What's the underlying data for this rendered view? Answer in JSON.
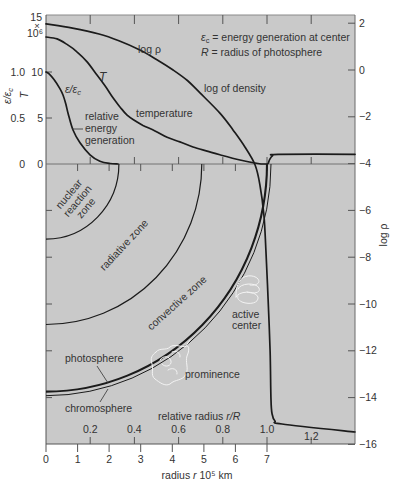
{
  "figure": {
    "colors": {
      "page_background": "#ffffff",
      "plot_background": "#c9c9c9",
      "curves": "#1b1b1b",
      "highlight_outline": "#f3f3f3"
    }
  },
  "chart_data": {
    "type": "line",
    "title": "",
    "legend_notes": [
      {
        "symbol": "ε",
        "sub": "c",
        "text": " = energy generation at center"
      },
      {
        "symbol": "R",
        "sub": "",
        "text": " = radius of photosphere"
      }
    ],
    "x_axes": {
      "bottom": {
        "label": "radius r 10⁵ km",
        "label_pre": "radius ",
        "label_var": "r",
        "label_post": " 10⁵ km",
        "ticks": [
          0,
          1,
          2,
          3,
          4,
          5,
          6,
          7
        ],
        "tick_labels": [
          "0",
          "1",
          "2",
          "3",
          "4",
          "5",
          "6",
          "7"
        ],
        "range": [
          0,
          9.8
        ]
      },
      "relative": {
        "label": "relative radius r/R",
        "label_pre": "relative radius ",
        "label_var": "r/R",
        "ticks": [
          0.2,
          0.4,
          0.6,
          0.8,
          1.0,
          1.2
        ],
        "tick_labels": [
          "0.2",
          "0.4",
          "0.6",
          "0.8",
          "1.0",
          "1.2"
        ],
        "range": [
          0,
          1.4
        ]
      }
    },
    "y_axes": {
      "left_T": {
        "label": "T",
        "unit": "10⁶ K",
        "ticks": [
          0,
          5,
          10,
          15
        ],
        "tick_labels": [
          "0",
          "5",
          "10"
        ],
        "top_label": {
          "value": "15",
          "times": "×",
          "multiplier": "10⁶"
        },
        "range": [
          0,
          16
        ]
      },
      "left_eps": {
        "label": "ε/εc",
        "label_main": "ε/ε",
        "label_sub": "c",
        "ticks": [
          0,
          0.5,
          1.0
        ],
        "tick_labels": [
          "0",
          "0.5",
          "1.0"
        ],
        "range": [
          0,
          1.6
        ]
      },
      "right_log_rho": {
        "label": "log ρ",
        "ticks": [
          2,
          0,
          -2,
          -4,
          -6,
          -8,
          -10,
          -12,
          -14,
          -16
        ],
        "tick_labels": [
          "2",
          "0",
          "−2",
          "−4",
          "−6",
          "−8",
          "−10",
          "−12",
          "−14",
          "−16"
        ],
        "range": [
          -16,
          2
        ]
      }
    },
    "series": [
      {
        "id": "log-density",
        "name": "log ρ",
        "label": "log of density",
        "axis": "right_log_rho",
        "x": "r/R",
        "points": [
          [
            0,
            1.97
          ],
          [
            0.12,
            1.79
          ],
          [
            0.24,
            1.54
          ],
          [
            0.33,
            1.25
          ],
          [
            0.425,
            0.85
          ],
          [
            0.5,
            0.45
          ],
          [
            0.575,
            0.0
          ],
          [
            0.64,
            -0.45
          ],
          [
            0.697,
            -0.98
          ],
          [
            0.787,
            -1.84
          ],
          [
            0.846,
            -2.56
          ],
          [
            0.9,
            -3.29
          ],
          [
            0.946,
            -4.06
          ],
          [
            0.968,
            -4.91
          ],
          [
            0.986,
            -6.2
          ],
          [
            0.995,
            -7.7
          ],
          [
            1.005,
            -9.8
          ],
          [
            1.014,
            -12.0
          ],
          [
            1.018,
            -14.1
          ],
          [
            1.023,
            -14.7
          ],
          [
            1.036,
            -15.0
          ],
          [
            1.068,
            -15.13
          ],
          [
            1.398,
            -15.47
          ]
        ]
      },
      {
        "id": "temperature",
        "name": "T",
        "label": "temperature",
        "axis": "left_T",
        "x": "r/R",
        "points": [
          [
            0,
            13.8
          ],
          [
            0.05,
            13.6
          ],
          [
            0.095,
            13.0
          ],
          [
            0.14,
            12.2
          ],
          [
            0.186,
            11.1
          ],
          [
            0.23,
            9.7
          ],
          [
            0.267,
            8.5
          ],
          [
            0.303,
            7.2
          ],
          [
            0.335,
            6.2
          ],
          [
            0.367,
            5.3
          ],
          [
            0.403,
            4.7
          ],
          [
            0.439,
            4.2
          ],
          [
            0.493,
            3.6
          ],
          [
            0.548,
            2.9
          ],
          [
            0.606,
            2.4
          ],
          [
            0.665,
            1.85
          ],
          [
            0.729,
            1.4
          ],
          [
            0.787,
            1.0
          ],
          [
            0.878,
            0.43
          ],
          [
            0.959,
            0.05
          ],
          [
            0.993,
            0.0
          ],
          [
            1.005,
            0.05
          ],
          [
            1.012,
            0.5
          ],
          [
            1.025,
            0.9
          ],
          [
            1.05,
            1.05
          ],
          [
            1.398,
            1.05
          ]
        ]
      },
      {
        "id": "relative-energy-generation",
        "name": "ε/εc",
        "label": "relative energy generation",
        "axis": "left_eps",
        "x": "r/R",
        "points": [
          [
            0,
            1.0
          ],
          [
            0.014,
            0.98
          ],
          [
            0.036,
            0.92
          ],
          [
            0.063,
            0.82
          ],
          [
            0.077,
            0.75
          ],
          [
            0.09,
            0.65
          ],
          [
            0.1,
            0.55
          ],
          [
            0.122,
            0.37
          ],
          [
            0.154,
            0.23
          ],
          [
            0.199,
            0.1
          ],
          [
            0.244,
            0.03
          ],
          [
            0.29,
            0.005
          ],
          [
            0.326,
            0.0
          ]
        ]
      }
    ],
    "zones": [
      {
        "id": "nuclear-reaction-zone",
        "name": "nuclear reaction zone",
        "outer_r_rel": 0.33
      },
      {
        "id": "radiative-zone",
        "name": "radiative zone",
        "outer_r_rel": 0.705
      },
      {
        "id": "photosphere",
        "name": "photosphere",
        "outer_r_rel": 1.0
      },
      {
        "id": "chromosphere",
        "name": "chromosphere",
        "outer_r_rel": 1.018
      }
    ],
    "annotations": {
      "log_rho_curve_label": "log ρ",
      "T_curve_label": "T",
      "eps_curve_label_main": "ε/ε",
      "eps_curve_label_sub": "c",
      "log_density": "log of density",
      "temperature": "temperature",
      "relative_energy_generation": [
        "relative",
        "energy",
        "generation"
      ],
      "nuclear_reaction_zone": [
        "nuclear",
        "reaction",
        "zone"
      ],
      "radiative_zone": "radiative zone",
      "convective_zone": "convective zone",
      "active_center": [
        "active",
        "center"
      ],
      "prominence": "prominence",
      "photosphere": "photosphere",
      "chromosphere": "chromosphere"
    }
  }
}
